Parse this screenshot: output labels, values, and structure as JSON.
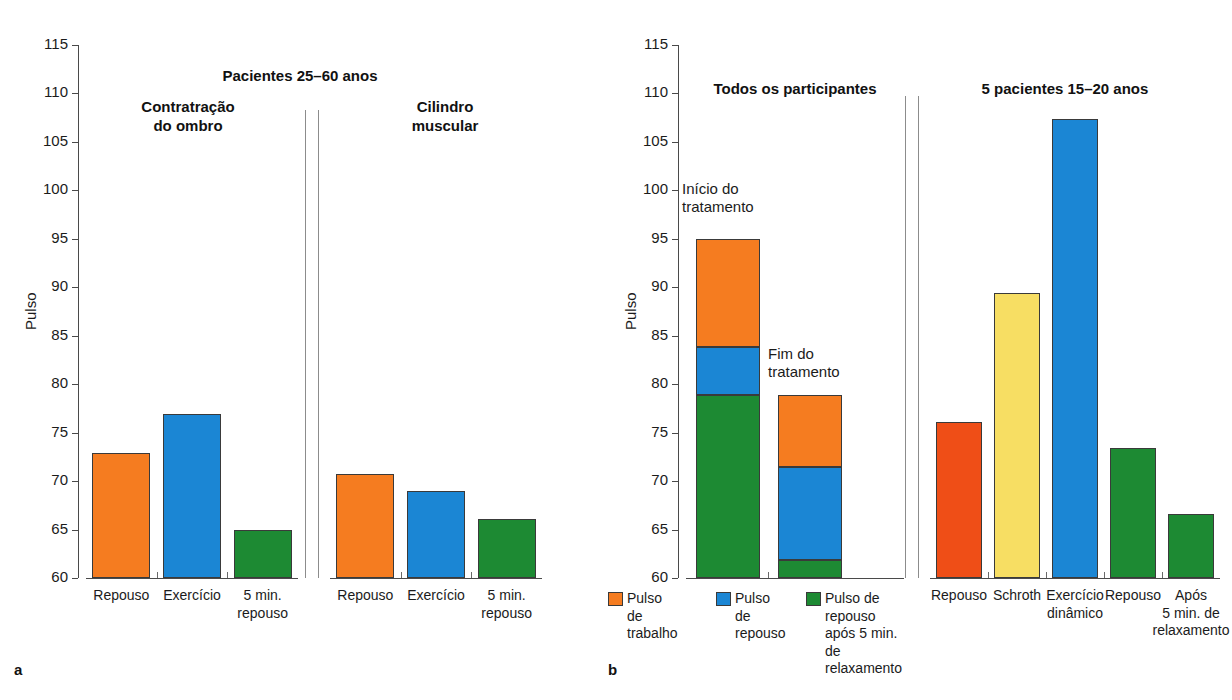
{
  "figure": {
    "panel_a_letter": "a",
    "panel_b_letter": "b",
    "ylabel": "Pulso"
  },
  "chart_data": [
    {
      "type": "bar",
      "panel": "a",
      "title": "Pacientes 25–60 anos",
      "xlabel": "",
      "ylabel": "Pulso",
      "ylim": [
        60,
        115
      ],
      "yticks": [
        60,
        65,
        70,
        75,
        80,
        85,
        90,
        95,
        100,
        105,
        110,
        115
      ],
      "grid": false,
      "legend": "none",
      "groups": [
        {
          "name": "Contratração do ombro",
          "categories": [
            "Repouso",
            "Exercício",
            "5 min.\nrepouso"
          ],
          "values": [
            72.9,
            76.9,
            65.0
          ],
          "colors": [
            "#F57C20",
            "#1B86D4",
            "#1D8A33"
          ]
        },
        {
          "name": "Cilindro muscular",
          "categories": [
            "Repouso",
            "Exercício",
            "5 min.\nrepouso"
          ],
          "values": [
            70.7,
            69.0,
            66.1
          ],
          "colors": [
            "#F57C20",
            "#1B86D4",
            "#1D8A33"
          ]
        }
      ]
    },
    {
      "type": "bar",
      "panel": "b-left",
      "title": "Todos os participantes",
      "xlabel": "",
      "ylabel": "Pulso",
      "ylim": [
        60,
        115
      ],
      "yticks": [
        60,
        65,
        70,
        75,
        80,
        85,
        90,
        95,
        100,
        105,
        110,
        115
      ],
      "grid": false,
      "stacked": true,
      "legend_position": "bottom",
      "categories": [
        "Início do tratamento",
        "Fim do tratamento"
      ],
      "series": [
        {
          "name": "Pulso de repouso após 5 min. de relaxamento",
          "color": "#1D8A33",
          "values": [
            78.9,
            61.9
          ]
        },
        {
          "name": "Pulso de repouso",
          "color": "#1B86D4",
          "values": [
            83.8,
            71.5
          ]
        },
        {
          "name": "Pulso de trabalho",
          "color": "#F57C20",
          "values": [
            95.0,
            78.9
          ]
        }
      ],
      "annotations": [
        "Início do\ntratamento",
        "Fim do\ntratamento"
      ],
      "legend_entries": [
        {
          "label": "Pulso de\ntrabalho",
          "color": "#F57C20"
        },
        {
          "label": "Pulso de\nrepouso",
          "color": "#1B86D4"
        },
        {
          "label": "Pulso de\nrepouso\napós 5 min.\nde relaxamento",
          "color": "#1D8A33"
        }
      ]
    },
    {
      "type": "bar",
      "panel": "b-right",
      "title": "5 pacientes 15–20 anos",
      "xlabel": "",
      "ylabel": "Pulso",
      "ylim": [
        60,
        115
      ],
      "yticks": [
        60,
        65,
        70,
        75,
        80,
        85,
        90,
        95,
        100,
        105,
        110,
        115
      ],
      "grid": false,
      "categories": [
        "Repouso",
        "Schroth",
        "Exercício\ndinâmico",
        "Repouso",
        "Após\n5 min. de\nrelaxamento"
      ],
      "values": [
        76.1,
        89.4,
        107.4,
        73.4,
        66.6
      ],
      "colors": [
        "#EF4E17",
        "#F7DE63",
        "#1B86D4",
        "#1D8A33",
        "#1D8A33"
      ]
    }
  ],
  "panel_a": {
    "super_title": "Pacientes 25–60 anos",
    "ytick_labels": [
      "115",
      "110",
      "105",
      "100",
      "95",
      "90",
      "85",
      "80",
      "75",
      "70",
      "65",
      "60"
    ],
    "axis_title": "Pulso",
    "groups": [
      {
        "title": "Contratração\ndo ombro",
        "title_line1": "Contratração",
        "title_line2": "do ombro",
        "bars": [
          {
            "label_line1": "Repouso",
            "label_line2": "",
            "value": 72.9
          },
          {
            "label_line1": "Exercício",
            "label_line2": "",
            "value": 76.9
          },
          {
            "label_line1": "5 min.",
            "label_line2": "repouso",
            "value": 65.0
          }
        ]
      },
      {
        "title": "Cilindro\nmuscular",
        "title_line1": "Cilindro",
        "title_line2": "muscular",
        "bars": [
          {
            "label_line1": "Repouso",
            "label_line2": "",
            "value": 70.7
          },
          {
            "label_line1": "Exercício",
            "label_line2": "",
            "value": 69.0
          },
          {
            "label_line1": "5 min.",
            "label_line2": "repouso",
            "value": 66.1
          }
        ]
      }
    ]
  },
  "panel_b": {
    "ytick_labels": [
      "115",
      "110",
      "105",
      "100",
      "95",
      "90",
      "85",
      "80",
      "75",
      "70",
      "65",
      "60"
    ],
    "axis_title": "Pulso",
    "left_title": "Todos os participantes",
    "right_title": "5 pacientes 15–20 anos",
    "annotations": [
      {
        "line1": "Início do",
        "line2": "tratamento"
      },
      {
        "line1": "Fim do",
        "line2": "tratamento"
      }
    ],
    "legend": [
      {
        "line1": "Pulso de",
        "line2": "trabalho",
        "line3": "",
        "line4": ""
      },
      {
        "line1": "Pulso de",
        "line2": "repouso",
        "line3": "",
        "line4": ""
      },
      {
        "line1": "Pulso de",
        "line2": "repouso",
        "line3": "após 5 min.",
        "line4": "de relaxamento"
      }
    ],
    "right_bars": [
      {
        "label_line1": "Repouso",
        "label_line2": "",
        "label_line3": "",
        "value": 76.1
      },
      {
        "label_line1": "Schroth",
        "label_line2": "",
        "label_line3": "",
        "value": 89.4
      },
      {
        "label_line1": "Exercício",
        "label_line2": "dinâmico",
        "label_line3": "",
        "value": 107.4
      },
      {
        "label_line1": "Repouso",
        "label_line2": "",
        "label_line3": "",
        "value": 73.4
      },
      {
        "label_line1": "Após",
        "label_line2": "5 min. de",
        "label_line3": "relaxamento",
        "value": 66.6
      }
    ]
  },
  "colors": {
    "orange": "#F57C20",
    "blue": "#1B86D4",
    "green": "#1D8A33",
    "red_orange": "#EF4E17",
    "yellow": "#F7DE63",
    "axis": "#4a4a4a"
  }
}
